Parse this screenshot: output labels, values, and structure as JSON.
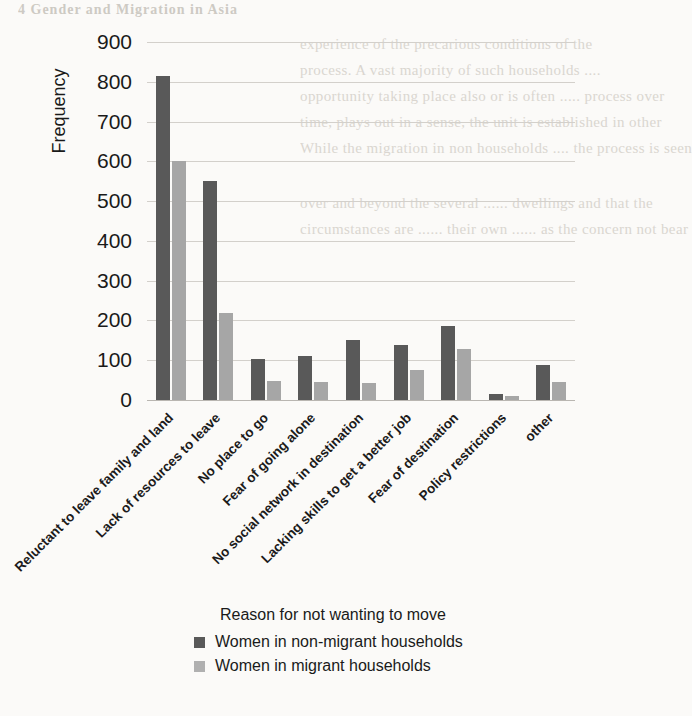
{
  "page": {
    "bleed_header": "4   Gender and Migration in Asia",
    "bleed_lines": [
      "experience of the precarious conditions of the",
      "process. A vast majority of such households ....",
      "opportunity taking place also or is often ..... process over",
      "time, plays out in a sense, the unit is established in other",
      "While the migration in non households .... the process is seen",
      "over and beyond the several ...... dwellings and that the",
      "circumstances are ...... their own ...... as the concern not bear"
    ]
  },
  "chart_data": {
    "type": "bar",
    "title": "",
    "xlabel": "Reason for not wanting to move",
    "ylabel": "Frequency",
    "ylim": [
      0,
      900
    ],
    "ytick_step": 100,
    "yticks": [
      900,
      800,
      700,
      600,
      500,
      400,
      300,
      200,
      100,
      0
    ],
    "grid": true,
    "legend_position": "bottom",
    "categories": [
      "Reluctant to leave family and land",
      "Lack of resources to leave",
      "No place to go",
      "Fear of going alone",
      "No social network in destination",
      "Lacking skills to get a better job",
      "Fear of destination",
      "Policy restrictions",
      "other"
    ],
    "series": [
      {
        "name": "Women in non-migrant households",
        "color": "#595959",
        "values": [
          815,
          550,
          102,
          110,
          152,
          138,
          186,
          15,
          88
        ]
      },
      {
        "name": "Women in migrant households",
        "color": "#a6a6a6",
        "values": [
          600,
          220,
          48,
          45,
          42,
          76,
          128,
          9,
          45
        ]
      }
    ]
  }
}
